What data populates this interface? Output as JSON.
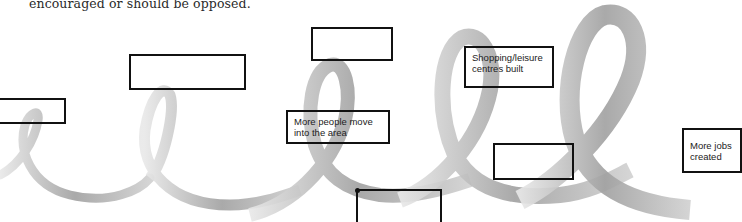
{
  "intro_text": "encouraged or should be opposed.",
  "diagram": {
    "type": "ribbon-flow",
    "ribbon_color": "#9a9a9a",
    "boxes": [
      {
        "id": "box-a",
        "label": ""
      },
      {
        "id": "box-b",
        "label": ""
      },
      {
        "id": "box-c",
        "label": ""
      },
      {
        "id": "box-d",
        "label": "More people move\ninto the area"
      },
      {
        "id": "box-e",
        "label": "Shopping/leisure\ncentres built"
      },
      {
        "id": "box-f",
        "label": ""
      },
      {
        "id": "box-g",
        "label": ""
      },
      {
        "id": "box-h",
        "label": "More jobs\ncreated"
      }
    ]
  }
}
